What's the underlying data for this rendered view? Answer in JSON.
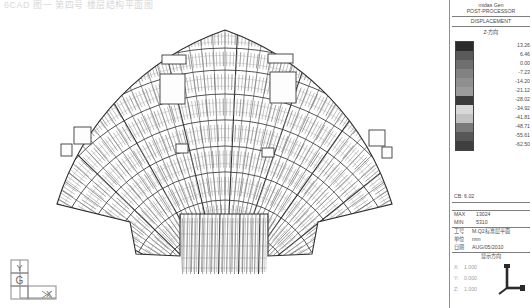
{
  "window": {
    "top_caption": "6CAD  图一    第四号  楼层结构平面图"
  },
  "panel": {
    "software_line": "midas Gen",
    "module_title": "POST-PROCESSOR",
    "result_type": "DISPLACEMENT",
    "component_label": "Z-方向",
    "legend": {
      "unit_hint": "",
      "values": [
        "13.26",
        "6.46",
        "0.00",
        "-7.23",
        "-14.20",
        "-21.12",
        "-28.02",
        "-34.92",
        "-41.81",
        "-48.71",
        "-55.61",
        "-62.50"
      ],
      "colors": [
        "#2b2b2b",
        "#5a5a5a",
        "#6e6e6e",
        "#828282",
        "#8f8f8f",
        "#9b9b9b",
        "#3a3a3a",
        "#d8d8d8",
        "#c2c2c2",
        "#7a7a7a",
        "#575757",
        "#3f3f3f"
      ]
    },
    "scale_line": "CB: 6.02",
    "max_label": "MAX",
    "max_value": "13024",
    "min_label": "MIN",
    "min_value": "5310",
    "job_label": "工号",
    "job_value": "M.Q2标准层平面",
    "unit_label": "单位",
    "unit_value": "mm",
    "date_label": "日期",
    "date_value": "AUG/05/2010",
    "view_title": "显示方向",
    "axes": [
      {
        "label": "X:",
        "value": "1.000"
      },
      {
        "label": "Y:",
        "value": "0.000"
      },
      {
        "label": "Z:",
        "value": "1.000"
      }
    ]
  },
  "axis_triad": {
    "y_label": "Y",
    "g_label": "G",
    "x_label": "X"
  },
  "model": {
    "description": "fan-shaped finite-element mesh of a curved stadium floor plan",
    "render_color": "#6e6e6e",
    "background": "#ffffff"
  },
  "chart_data": {
    "type": "heatmap",
    "title": "DISPLACEMENT",
    "subtitle": "POST-PROCESSOR",
    "component": "Z-方向",
    "unit": "mm",
    "legend_position": "right",
    "grid": false,
    "colorbar_stops": [
      "13.26",
      "6.46",
      "0.00",
      "-7.23",
      "-14.20",
      "-21.12",
      "-28.02",
      "-34.92",
      "-41.81",
      "-48.71",
      "-55.61",
      "-62.50"
    ],
    "vmin": -62.5,
    "vmax": 13.26,
    "annotations": [
      "CB: 6.02",
      "MAX 13024",
      "MIN 5310"
    ]
  }
}
